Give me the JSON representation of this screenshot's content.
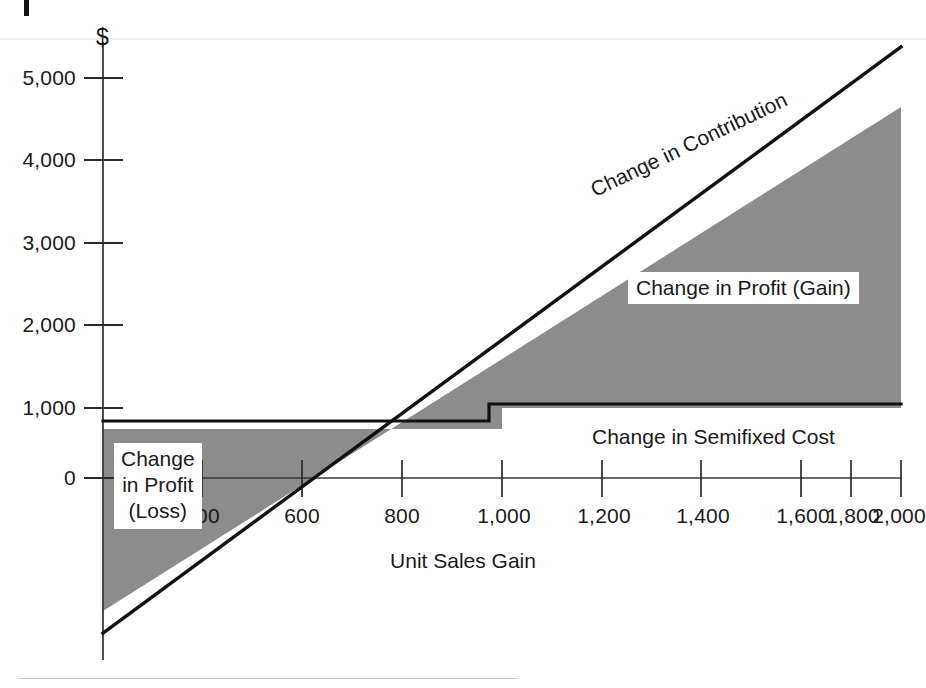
{
  "chart_data": {
    "type": "area",
    "title": "",
    "xlabel": "Unit Sales Gain",
    "ylabel": "$",
    "xlim": [
      0,
      2000
    ],
    "ylim": [
      -1900,
      5400
    ],
    "grid": false,
    "legend_position": "inline-annotations",
    "x_ticks": [
      400,
      600,
      800,
      1000,
      1200,
      1400,
      1600,
      1800,
      2000
    ],
    "x_tick_labels": [
      "400",
      "600",
      "800",
      "1,000",
      "1,200",
      "1,400",
      "1,600",
      "1,800",
      "2,000"
    ],
    "y_ticks": [
      0,
      1000,
      2000,
      3000,
      4000,
      5000
    ],
    "y_tick_labels": [
      "0",
      "1,000",
      "2,000",
      "3,000",
      "4,000",
      "5,000"
    ],
    "series": [
      {
        "name": "Change in Contribution",
        "type": "line",
        "x": [
          0,
          2000
        ],
        "values": [
          -1900,
          5300
        ]
      },
      {
        "name": "Change in Semifixed Cost",
        "type": "step",
        "x": [
          0,
          1000,
          1000,
          2000
        ],
        "values": [
          700,
          700,
          1000,
          1000
        ]
      }
    ],
    "shaded_regions": [
      {
        "name": "Change in Profit (Loss)",
        "x_range": [
          0,
          700
        ],
        "description": "Area where contribution is below semifixed cost"
      },
      {
        "name": "Change in Profit (Gain)",
        "x_range": [
          700,
          2000
        ],
        "description": "Area where contribution exceeds semifixed cost"
      }
    ],
    "annotations": [
      {
        "text": "Change in Contribution",
        "rotation": -25.5
      },
      {
        "text": "Change in Profit (Gain)",
        "rotation": 0
      },
      {
        "text": "Change in Profit\n(Loss)",
        "rotation": 0
      },
      {
        "text": "Change in Semifixed Cost",
        "rotation": 0
      }
    ],
    "colors": {
      "fill": "#8c8c8c",
      "line": "#111111",
      "axis": "#3a3a3a",
      "text": "#1a1a1a",
      "background": "#ffffff"
    }
  },
  "axes": {
    "y_axis_symbol": "$",
    "x_axis_title": "Unit Sales Gain",
    "y_tick_labels": [
      "5,000",
      "4,000",
      "3,000",
      "2,000",
      "1,000",
      "0"
    ],
    "x_tick_labels": [
      "400",
      "600",
      "800",
      "1,000",
      "1,200",
      "1,400",
      "1,600",
      "1,800",
      "2,000"
    ]
  },
  "labels": {
    "contribution": "Change in Contribution",
    "profit_gain": "Change in Profit (Gain)",
    "profit_loss_line1": "Change",
    "profit_loss_line2": "in Profit",
    "profit_loss_line3": "(Loss)",
    "semifixed_cost": "Change in Semifixed Cost"
  }
}
